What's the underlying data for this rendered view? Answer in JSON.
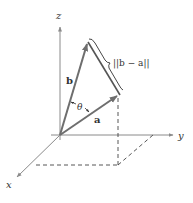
{
  "diagram": {
    "axes": {
      "x_label": "x",
      "y_label": "y",
      "z_label": "z"
    },
    "vectors": {
      "a_label": "a",
      "b_label": "b"
    },
    "angle_label": "θ",
    "difference_label": "||b − a||",
    "colors": {
      "axis": "#8a8a8a",
      "vector": "#6e6e6e",
      "dashed": "#444444",
      "text": "#333333"
    }
  }
}
